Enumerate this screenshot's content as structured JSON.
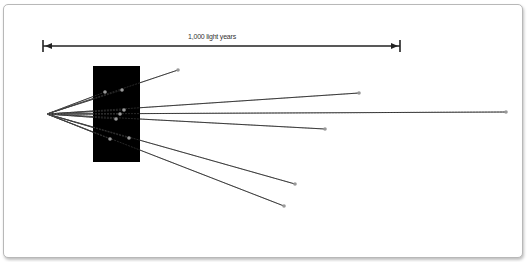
{
  "scale_bar": {
    "label": "1,000 light years",
    "x1": 43,
    "x2": 400,
    "y": 46
  },
  "observer": {
    "x": 47,
    "y": 114
  },
  "occluder": {
    "x": 93,
    "y": 66,
    "width": 47,
    "height": 96,
    "color": "#000000"
  },
  "stars": [
    {
      "x": 178,
      "y": 70
    },
    {
      "x": 105,
      "y": 92
    },
    {
      "x": 122,
      "y": 90
    },
    {
      "x": 359,
      "y": 93
    },
    {
      "x": 124,
      "y": 110
    },
    {
      "x": 506,
      "y": 112
    },
    {
      "x": 120,
      "y": 114
    },
    {
      "x": 116,
      "y": 119
    },
    {
      "x": 325,
      "y": 129
    },
    {
      "x": 110,
      "y": 139
    },
    {
      "x": 129,
      "y": 138
    },
    {
      "x": 295,
      "y": 184
    },
    {
      "x": 284,
      "y": 206
    }
  ],
  "colors": {
    "line": "#333333",
    "star": "#999999",
    "frame": "#b8b8b8"
  }
}
